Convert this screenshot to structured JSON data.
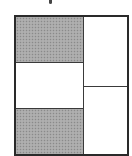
{
  "figure": {
    "type": "partitioned-rectangle",
    "colors": {
      "border": "#2a2a2a",
      "shaded": "#a8a8a8",
      "unshaded": "#ffffff"
    },
    "left_column": {
      "cells": [
        {
          "position": "top",
          "shaded": true
        },
        {
          "position": "middle",
          "shaded": false
        },
        {
          "position": "bottom",
          "shaded": true
        }
      ]
    },
    "right_column": {
      "cells": [
        {
          "position": "top",
          "shaded": false
        },
        {
          "position": "bottom",
          "shaded": false
        }
      ]
    },
    "shaded_count": 2,
    "total_parts": 5
  }
}
